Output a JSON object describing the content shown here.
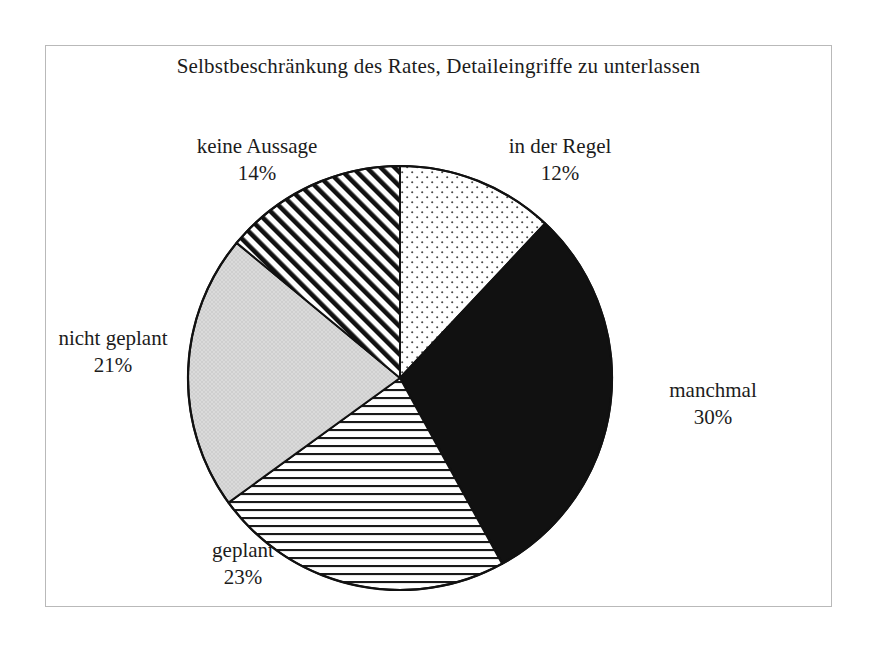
{
  "chart_data": {
    "type": "pie",
    "title": "Selbstbeschränkung des Rates, Detaileingriffe zu unterlassen",
    "xlabel": "",
    "ylabel": "",
    "legend_position": "none",
    "grid": false,
    "start_angle_deg": 0,
    "direction": "clockwise",
    "categories": [
      "in der Regel",
      "manchmal",
      "geplant",
      "nicht geplant",
      "keine Aussage"
    ],
    "values": [
      12,
      30,
      23,
      21,
      14
    ],
    "value_unit": "%",
    "slices": [
      {
        "label": "in der Regel",
        "value": 12,
        "value_text": "12%",
        "pattern": "dotted",
        "fill": "#ffffff",
        "pattern_color": "#3a3a3a",
        "start_deg": 0,
        "end_deg": 43.2
      },
      {
        "label": "manchmal",
        "value": 30,
        "value_text": "30%",
        "pattern": "solid",
        "fill": "#111111",
        "pattern_color": "#111111",
        "start_deg": 43.2,
        "end_deg": 151.2
      },
      {
        "label": "geplant",
        "value": 23,
        "value_text": "23%",
        "pattern": "horizontal-lines",
        "fill": "#ffffff",
        "pattern_color": "#1a1a1a",
        "start_deg": 151.2,
        "end_deg": 234.0
      },
      {
        "label": "nicht geplant",
        "value": 21,
        "value_text": "21%",
        "pattern": "light-gray",
        "fill": "#d9d9d9",
        "pattern_color": "#d9d9d9",
        "start_deg": 234.0,
        "end_deg": 309.6
      },
      {
        "label": "keine Aussage",
        "value": 14,
        "value_text": "14%",
        "pattern": "diagonal-stripes",
        "fill": "#ffffff",
        "pattern_color": "#111111",
        "start_deg": 309.6,
        "end_deg": 360.0
      }
    ],
    "colors": {
      "outline": "#111111",
      "frame": "#b9b9b9",
      "text": "#1c1c1c",
      "background": "#ffffff"
    }
  },
  "labels": {
    "keine_aussage": {
      "name": "keine Aussage",
      "value": "14%"
    },
    "in_der_regel": {
      "name": "in der Regel",
      "value": "12%"
    },
    "manchmal": {
      "name": "manchmal",
      "value": "30%"
    },
    "nicht_geplant": {
      "name": "nicht geplant",
      "value": "21%"
    },
    "geplant": {
      "name": "geplant",
      "value": "23%"
    }
  }
}
